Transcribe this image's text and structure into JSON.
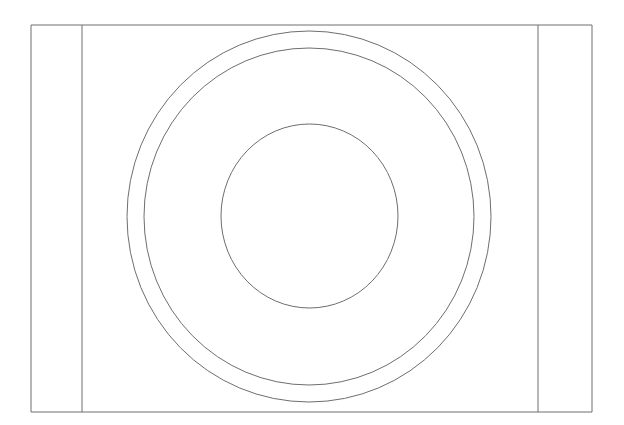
{
  "document": {
    "title": "Concentric Circles Technical Line Drawing",
    "type": "line-art-schematic",
    "canvas_width": 624,
    "canvas_height": 425,
    "background_color": "#ffffff",
    "stroke_color": "#6e6e6e",
    "stroke_width": 1,
    "description": "Front elevation line drawing: a rectangular outline divided into three vertical panels by two interior vertical lines, with three concentric circles centered on the middle panel."
  },
  "shapes": {
    "frame": {
      "label": "Outer rectangle frame",
      "x": 31,
      "y": 25,
      "width": 561,
      "height": 387,
      "stroke_color": "#6e6e6e",
      "fill": "none"
    },
    "dividers": [
      {
        "label": "Left vertical divider",
        "x": 82,
        "y1": 25,
        "y2": 412,
        "stroke_color": "#6e6e6e"
      },
      {
        "label": "Right vertical divider",
        "x": 538,
        "y1": 25,
        "y2": 412,
        "stroke_color": "#6e6e6e"
      }
    ],
    "circles": [
      {
        "label": "Outer circle",
        "cx": 309,
        "cy": 216.5,
        "rx": 182,
        "ry": 185.5,
        "stroke_color": "#6e6e6e",
        "fill": "none"
      },
      {
        "label": "Middle circle",
        "cx": 309,
        "cy": 216.5,
        "rx": 165,
        "ry": 168.5,
        "stroke_color": "#6e6e6e",
        "fill": "none"
      },
      {
        "label": "Inner circle",
        "cx": 309.5,
        "cy": 216,
        "rx": 88.5,
        "ry": 92,
        "stroke_color": "#6e6e6e",
        "fill": "none"
      }
    ],
    "panels": [
      {
        "label": "Left panel",
        "x": 31,
        "y": 25,
        "width": 51,
        "height": 387
      },
      {
        "label": "Center panel",
        "x": 82,
        "y": 25,
        "width": 456,
        "height": 387
      },
      {
        "label": "Right panel",
        "x": 538,
        "y": 25,
        "width": 54,
        "height": 387
      }
    ]
  }
}
